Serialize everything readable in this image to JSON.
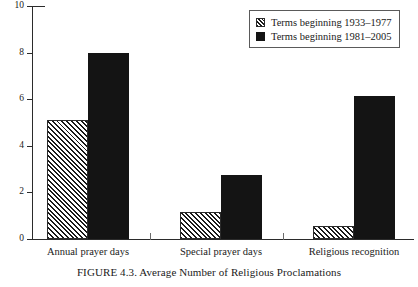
{
  "caption": "FIGURE 4.3.  Average Number of Religious Proclamations",
  "legend": {
    "items": [
      {
        "label": "Terms beginning 1933–1977",
        "swatch": "hatched-swatch"
      },
      {
        "label": "Terms  beginning 1981–2005",
        "swatch": "solid-swatch"
      }
    ]
  },
  "colors": {
    "series_1_fill": "#ffffff",
    "series_1_hatch": "#1a1a1a",
    "series_2_fill": "#141414",
    "axis": "#2b2b2b",
    "background": "#ffffff",
    "text": "#1a1a1a"
  },
  "chart_data": {
    "type": "bar",
    "title": "",
    "subtitle": "",
    "xlabel": "",
    "ylabel": "",
    "categories": [
      "Annual prayer days",
      "Special prayer days",
      "Religious recognition"
    ],
    "series": [
      {
        "name": "Terms beginning 1933–1977",
        "values": [
          5.1,
          1.15,
          0.55
        ]
      },
      {
        "name": "Terms  beginning 1981–2005",
        "values": [
          8.0,
          2.75,
          6.15
        ]
      }
    ],
    "ylim": [
      0,
      10
    ],
    "yticks": [
      0,
      2,
      4,
      6,
      8,
      10
    ],
    "ytick_labels": [
      "0",
      "2",
      "4",
      "6",
      "8",
      "10"
    ],
    "grid": false,
    "legend_position": "top-right"
  }
}
